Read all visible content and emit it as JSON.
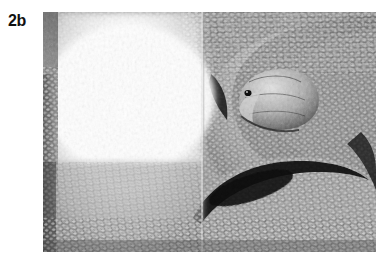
{
  "figure": {
    "panel_label": "2b",
    "caption": "",
    "media_type": "grayscale-photograph",
    "frame": {
      "x": 43,
      "y": 12,
      "width": 333,
      "height": 240
    },
    "composition": {
      "seam_x_ratio": 0.48,
      "left_panel_note": "overexposed blown-out highlight region",
      "right_panel_note": "normal exposure, dense scale texture",
      "left_edge_strip_note": "dark vertical band along left border",
      "head_position_ratio": {
        "x": 0.63,
        "y": 0.28
      },
      "eye_position_ratio": {
        "x": 0.6,
        "y": 0.27
      },
      "dark_coil_crevice_ratio": {
        "x": 0.6,
        "y": 0.68
      }
    },
    "palette": {
      "background": "#ffffff",
      "label_color": "#111111",
      "photo_base_gray": "#7a7a7a",
      "photo_dark": "#141414",
      "photo_mid": "#8b8b8b",
      "photo_light": "#f4f4f4",
      "photo_blowout": "#ffffff",
      "left_strip_dark": "#6b6b6b"
    }
  }
}
